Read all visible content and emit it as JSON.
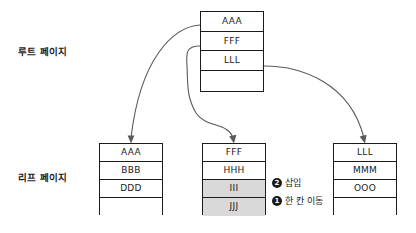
{
  "diagram": {
    "labels": {
      "root_level": "루트 페이지",
      "leaf_level": "리프 페이지"
    },
    "root_page": {
      "name": "root-page",
      "rows": [
        {
          "value": "AAA",
          "shaded": false
        },
        {
          "value": "FFF",
          "shaded": false
        },
        {
          "value": "LLL",
          "shaded": false
        },
        {
          "value": "",
          "shaded": false
        }
      ]
    },
    "leaf_pages": [
      {
        "name": "leaf-page-1",
        "rows": [
          {
            "value": "AAA",
            "shaded": false
          },
          {
            "value": "BBB",
            "shaded": false
          },
          {
            "value": "DDD",
            "shaded": false
          },
          {
            "value": "",
            "shaded": false
          }
        ]
      },
      {
        "name": "leaf-page-2",
        "rows": [
          {
            "value": "FFF",
            "shaded": false
          },
          {
            "value": "HHH",
            "shaded": false
          },
          {
            "value": "III",
            "shaded": true
          },
          {
            "value": "JJJ",
            "shaded": true
          }
        ]
      },
      {
        "name": "leaf-page-3",
        "rows": [
          {
            "value": "LLL",
            "shaded": false
          },
          {
            "value": "MMM",
            "shaded": false
          },
          {
            "value": "OOO",
            "shaded": false
          },
          {
            "value": "",
            "shaded": false
          }
        ]
      }
    ],
    "annotations": [
      {
        "marker": "❷",
        "marker_number": "2",
        "text": "삽입"
      },
      {
        "marker": "❶",
        "marker_number": "1",
        "text": "한 칸 이동"
      }
    ],
    "pointers": [
      {
        "from_key": "AAA",
        "to_page": "leaf-page-1"
      },
      {
        "from_key": "FFF",
        "to_page": "leaf-page-2"
      },
      {
        "from_key": "LLL",
        "to_page": "leaf-page-3"
      }
    ],
    "colors": {
      "line": "#1a1a1a",
      "arrow": "#5a5a5a",
      "shade": "#d9d9d9",
      "background": "#ffffff"
    }
  }
}
